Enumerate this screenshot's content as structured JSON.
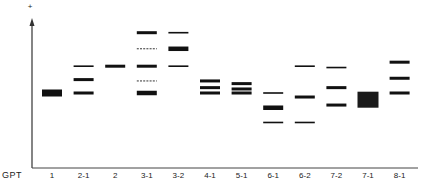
{
  "diagram": {
    "type": "gel-electrophoresis-schematic",
    "row_label": "GPT",
    "polarity_marker": "+",
    "lanes": [
      {
        "label": "1",
        "bands": [
          {
            "pos": 0.5,
            "weight": "block"
          }
        ]
      },
      {
        "label": "2-1",
        "bands": [
          {
            "pos": 0.3,
            "weight": "thin"
          },
          {
            "pos": 0.4,
            "weight": "medium"
          },
          {
            "pos": 0.5,
            "weight": "medium"
          }
        ]
      },
      {
        "label": "2",
        "bands": [
          {
            "pos": 0.3,
            "weight": "medium"
          }
        ]
      },
      {
        "label": "3-1",
        "bands": [
          {
            "pos": 0.05,
            "weight": "medium"
          },
          {
            "pos": 0.17,
            "weight": "dashed"
          },
          {
            "pos": 0.3,
            "weight": "medium"
          },
          {
            "pos": 0.41,
            "weight": "dashed"
          },
          {
            "pos": 0.5,
            "weight": "thick"
          }
        ]
      },
      {
        "label": "3-2",
        "bands": [
          {
            "pos": 0.05,
            "weight": "thin"
          },
          {
            "pos": 0.17,
            "weight": "thick"
          },
          {
            "pos": 0.3,
            "weight": "thin"
          }
        ]
      },
      {
        "label": "4-1",
        "bands": [
          {
            "pos": 0.41,
            "weight": "medium"
          },
          {
            "pos": 0.46,
            "weight": "medium"
          },
          {
            "pos": 0.5,
            "weight": "medium"
          }
        ]
      },
      {
        "label": "5-1",
        "bands": [
          {
            "pos": 0.43,
            "weight": "medium"
          },
          {
            "pos": 0.47,
            "weight": "medium"
          },
          {
            "pos": 0.5,
            "weight": "medium"
          }
        ]
      },
      {
        "label": "6-1",
        "bands": [
          {
            "pos": 0.5,
            "weight": "thin"
          },
          {
            "pos": 0.61,
            "weight": "thick"
          },
          {
            "pos": 0.72,
            "weight": "thin"
          }
        ]
      },
      {
        "label": "6-2",
        "bands": [
          {
            "pos": 0.3,
            "weight": "thin"
          },
          {
            "pos": 0.53,
            "weight": "medium"
          },
          {
            "pos": 0.72,
            "weight": "thin"
          }
        ]
      },
      {
        "label": "7-2",
        "bands": [
          {
            "pos": 0.31,
            "weight": "thin"
          },
          {
            "pos": 0.46,
            "weight": "medium"
          },
          {
            "pos": 0.59,
            "weight": "medium"
          }
        ]
      },
      {
        "label": "7-1",
        "bands": [
          {
            "pos": 0.55,
            "weight": "block-large"
          }
        ]
      },
      {
        "label": "8-1",
        "bands": [
          {
            "pos": 0.27,
            "weight": "medium"
          },
          {
            "pos": 0.39,
            "weight": "medium"
          },
          {
            "pos": 0.5,
            "weight": "medium"
          }
        ]
      }
    ]
  }
}
